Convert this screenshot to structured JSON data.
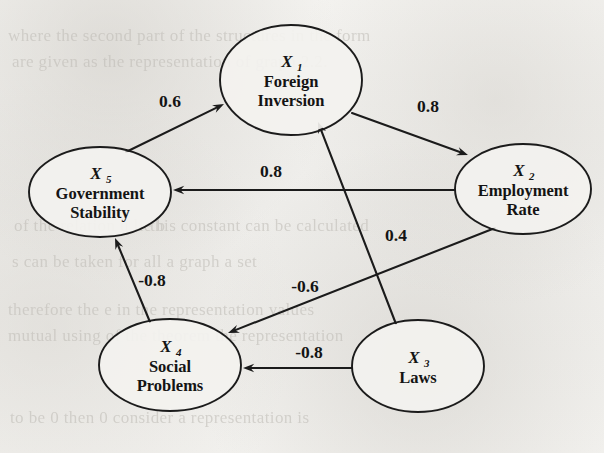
{
  "figure": {
    "kind": "causal-influence-diagram",
    "background_color": "#f2f1ee",
    "ink_color": "#1b1b1b"
  },
  "ghost_text": [
    {
      "text": "where the second part of the structures in the form",
      "x": 8,
      "y": 26
    },
    {
      "text": "are given as the representation of graph 2.2.",
      "x": 12,
      "y": 52
    },
    {
      "text": "of  the  relation  u  lie  b",
      "x": 14,
      "y": 216
    },
    {
      "text": "this  constant   can  be  calculated",
      "x": 150,
      "y": 216
    },
    {
      "text": "s  can  be  taken  for  all  a  graph  a  set",
      "x": 12,
      "y": 252
    },
    {
      "text": "therefore  the  e  in  the  representation  values",
      "x": 8,
      "y": 300
    },
    {
      "text": "mutual  using  of  the  theorem  the  representation",
      "x": 8,
      "y": 326
    },
    {
      "text": "to  be  0  then  0  consider  a  representation  is",
      "x": 10,
      "y": 408
    }
  ],
  "nodes": [
    {
      "id": "X1",
      "var": "X",
      "sub": "1",
      "label_lines": [
        "Foreign",
        "Inversion"
      ],
      "cx": 291,
      "cy": 80,
      "rx": 71,
      "ry": 55
    },
    {
      "id": "X2",
      "var": "X",
      "sub": "2",
      "label_lines": [
        "Employment",
        "Rate"
      ],
      "cx": 523,
      "cy": 189,
      "rx": 68,
      "ry": 45
    },
    {
      "id": "X3",
      "var": "X",
      "sub": "3",
      "label_lines": [
        "Laws"
      ],
      "cx": 418,
      "cy": 366,
      "rx": 66,
      "ry": 46
    },
    {
      "id": "X4",
      "var": "X",
      "sub": "4",
      "label_lines": [
        "Social",
        "Problems"
      ],
      "cx": 170,
      "cy": 365,
      "rx": 71,
      "ry": 46
    },
    {
      "id": "X5",
      "var": "X",
      "sub": "5",
      "label_lines": [
        "Government",
        "Stability"
      ],
      "cx": 100,
      "cy": 192,
      "rx": 71,
      "ry": 45
    }
  ],
  "edges": [
    {
      "id": "e1",
      "from": "X5",
      "to": "X1",
      "weight": "0.6",
      "x1": 126,
      "y1": 152,
      "x2": 224,
      "y2": 104,
      "label_x": 170,
      "label_y": 107
    },
    {
      "id": "e2",
      "from": "X1",
      "to": "X2",
      "weight": "0.8",
      "x1": 352,
      "y1": 113,
      "x2": 468,
      "y2": 155,
      "label_x": 428,
      "label_y": 112
    },
    {
      "id": "e3",
      "from": "X2",
      "to": "X5",
      "weight": "0.8",
      "x1": 455,
      "y1": 190,
      "x2": 173,
      "y2": 190,
      "label_x": 271,
      "label_y": 177
    },
    {
      "id": "e4",
      "from": "X3",
      "to": "X1",
      "weight": "0.4",
      "x1": 396,
      "y1": 324,
      "x2": 318,
      "y2": 122,
      "label_x": 396,
      "label_y": 241
    },
    {
      "id": "e5",
      "from": "X4",
      "to": "X5",
      "weight": "-0.8",
      "x1": 150,
      "y1": 322,
      "x2": 115,
      "y2": 238,
      "label_x": 152,
      "label_y": 286
    },
    {
      "id": "e6",
      "from": "X2",
      "to": "X4",
      "weight": "-0.6",
      "x1": 495,
      "y1": 228,
      "x2": 228,
      "y2": 333,
      "label_x": 305,
      "label_y": 292
    },
    {
      "id": "e7",
      "from": "X3",
      "to": "X4",
      "weight": "-0.8",
      "x1": 352,
      "y1": 368,
      "x2": 243,
      "y2": 368,
      "label_x": 309,
      "label_y": 358
    }
  ]
}
